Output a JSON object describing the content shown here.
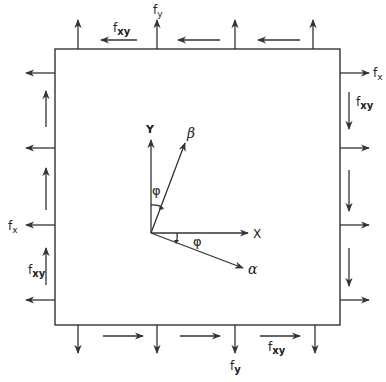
{
  "diagram": {
    "type": "stress-element",
    "box": {
      "x": 55,
      "y": 49,
      "w": 285,
      "h": 276
    },
    "colors": {
      "stroke": "#333333",
      "text": "#222222",
      "background": "#ffffff"
    },
    "labels": {
      "fy_top": {
        "base": "f",
        "sub": "y"
      },
      "fxy_top": {
        "base": "f",
        "sub": "xy"
      },
      "fx_right": {
        "base": "f",
        "sub": "x"
      },
      "fxy_right": {
        "base": "f",
        "sub": "xy"
      },
      "fx_left": {
        "base": "f",
        "sub": "x"
      },
      "fxy_left": {
        "base": "f",
        "sub": "xy"
      },
      "fy_bottom": {
        "base": "f",
        "sub": "y"
      },
      "fxy_bottom": {
        "base": "f",
        "sub": "xy"
      }
    },
    "axes": {
      "origin": [
        151,
        233
      ],
      "x_label": "X",
      "y_label": "Y",
      "alpha_label": "α",
      "beta_label": "β",
      "angle_label_upper": "φ",
      "angle_label_lower": "φ"
    },
    "arrows": {
      "top_normal_x": [
        78,
        157,
        235,
        313
      ],
      "bottom_normal_x": [
        78,
        157,
        235,
        315
      ],
      "left_normal_y": [
        73,
        148,
        225,
        300
      ],
      "right_normal_y": [
        73,
        148,
        225,
        300
      ],
      "top_shear": [
        [
          137,
          100
        ],
        [
          220,
          178
        ],
        [
          300,
          258
        ]
      ],
      "bottom_shear": [
        [
          103,
          143
        ],
        [
          180,
          220
        ],
        [
          260,
          300
        ]
      ],
      "left_shear": [
        [
          127,
          92
        ],
        [
          210,
          168
        ],
        [
          285,
          248
        ]
      ],
      "right_shear": [
        [
          92,
          128
        ],
        [
          170,
          210
        ],
        [
          248,
          285
        ]
      ]
    }
  }
}
